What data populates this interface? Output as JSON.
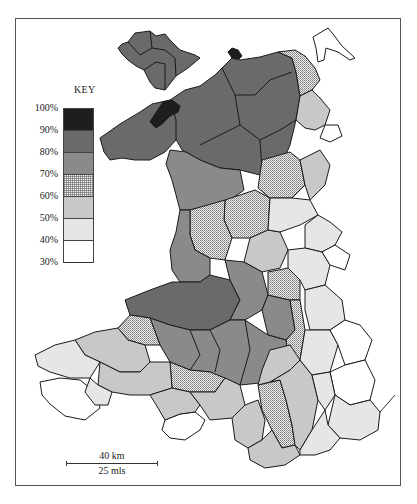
{
  "map": {
    "subject": "Wales",
    "fill_legend_colors": {
      "90-100": "#1e1e1e",
      "80-90": "#6a6a6a",
      "70-80": "#8a8a8a",
      "60-70": "checker",
      "50-60": "#c8c8c8",
      "40-50": "#e6e6e6",
      "30-40": "#ffffff"
    }
  },
  "key": {
    "title": "KEY",
    "labels": [
      "100%",
      "90%",
      "80%",
      "70%",
      "60%",
      "50%",
      "40%",
      "30%"
    ],
    "bands": [
      {
        "range": "90%–100%",
        "fill": "#1e1e1e"
      },
      {
        "range": "80%–90%",
        "fill": "#6a6a6a"
      },
      {
        "range": "70%–80%",
        "fill": "#8a8a8a"
      },
      {
        "range": "60%–70%",
        "fill": "checker"
      },
      {
        "range": "50%–60%",
        "fill": "#c8c8c8"
      },
      {
        "range": "40%–50%",
        "fill": "#e6e6e6"
      },
      {
        "range": "30%–40%",
        "fill": "#ffffff"
      }
    ]
  },
  "scale_bar": {
    "km_label": "40 km",
    "miles_label": "25 mls"
  }
}
